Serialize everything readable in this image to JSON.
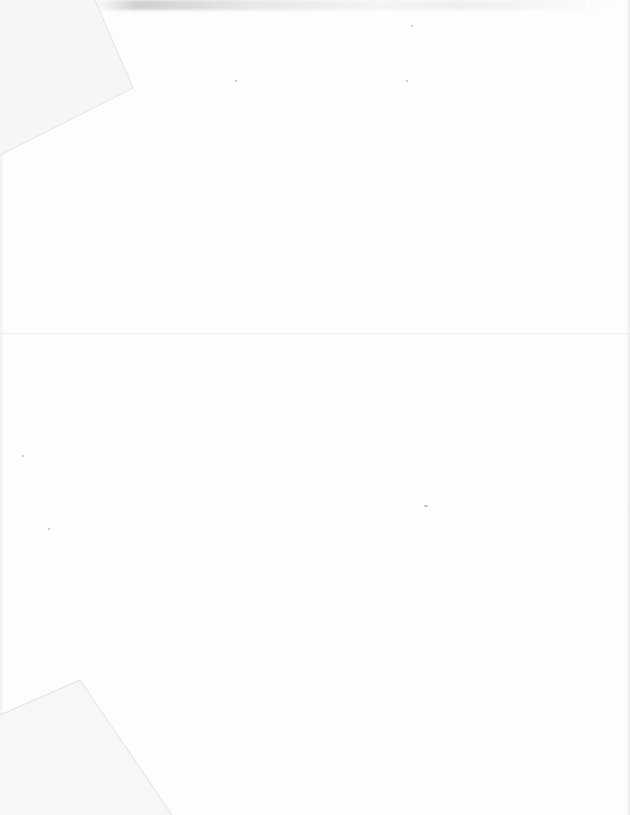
{
  "document": {
    "type": "scanned blank page",
    "text_content": "",
    "colors": {
      "paper": "#fdfdfd",
      "fold_line": "#ececec",
      "smudge": "#aaaaaa"
    }
  }
}
